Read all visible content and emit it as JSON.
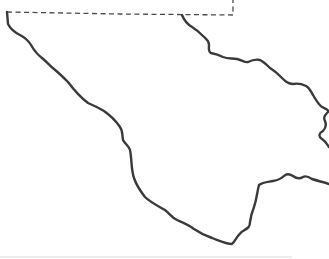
{
  "map": {
    "type": "outline-map",
    "colors": {
      "background": "#ffffff",
      "border": "#3a3a3a",
      "boundary_dashed": "#4a4a4a",
      "rule": "#ececec"
    },
    "features": [
      {
        "name": "dashed-boundary",
        "style": "dashed",
        "description": "straight political boundary across top"
      },
      {
        "name": "southwest-river-boundary",
        "style": "solid"
      },
      {
        "name": "east-river-boundary",
        "style": "solid"
      },
      {
        "name": "south-east-river-boundary",
        "style": "solid"
      }
    ]
  }
}
